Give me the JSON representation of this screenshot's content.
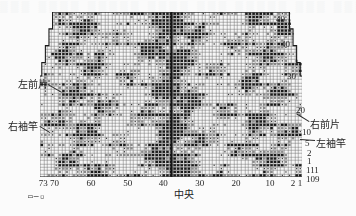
{
  "figure": {
    "kind": "knitting-chart",
    "shape": "trapezoid-stepped",
    "ghost_top": "▒▒▒  ▒▒▒▒  ▒▒▒▒▒  ▒▒▒▒  ▒▒▒  ▒▒▒▒▒  ▒▒▒  ▒▒▒▒",
    "ghost_bottom": " "
  },
  "labels": {
    "left": [
      {
        "text": "左前片",
        "x": 18,
        "y": 80
      },
      {
        "text": "右袖竿",
        "x": 8,
        "y": 122
      }
    ],
    "right": [
      {
        "text": "右前片",
        "x": 310,
        "y": 120
      },
      {
        "text": "左袖竿",
        "x": 316,
        "y": 139
      }
    ],
    "center_bottom": {
      "text": "中央",
      "x": 174,
      "y": 190
    }
  },
  "row_numbers": [
    {
      "value": "49",
      "x": 276,
      "y": 15
    },
    {
      "value": "40",
      "x": 281,
      "y": 40
    },
    {
      "value": "30",
      "x": 287,
      "y": 72
    },
    {
      "value": "20",
      "x": 296,
      "y": 106
    },
    {
      "value": "10",
      "x": 302,
      "y": 128
    },
    {
      "value": "5",
      "x": 305,
      "y": 139
    },
    {
      "value": "2",
      "x": 307,
      "y": 149
    },
    {
      "value": "1",
      "x": 307,
      "y": 157
    },
    {
      "value": "111",
      "x": 306,
      "y": 166
    },
    {
      "value": "109",
      "x": 306,
      "y": 175
    }
  ],
  "x_ticks": [
    {
      "value": "73",
      "pos": 0.012
    },
    {
      "value": "70",
      "pos": 0.055
    },
    {
      "value": "60",
      "pos": 0.195
    },
    {
      "value": "50",
      "pos": 0.335
    },
    {
      "value": "40",
      "pos": 0.47
    },
    {
      "value": "30",
      "pos": 0.61
    },
    {
      "value": "20",
      "pos": 0.748
    },
    {
      "value": "10",
      "pos": 0.878
    },
    {
      "value": "2",
      "pos": 0.966
    },
    {
      "value": "1",
      "pos": 0.992
    }
  ],
  "legend_symbol": "▭─▫",
  "colors": {
    "ink": "#232323",
    "grid": "#6b6b6b",
    "fill_dark": "#1a1a1a",
    "fill_mid": "#8a8a8a",
    "paper": "#fbfbfb",
    "center_line": "#141414"
  },
  "chart_data": {
    "type": "heatmap",
    "title": "",
    "xlabel": "",
    "ylabel": "",
    "grid": true,
    "legend": "none",
    "cols": 73,
    "rows": 49,
    "x_tick_labels": [
      "73",
      "70",
      "60",
      "50",
      "40",
      "30",
      "20",
      "10",
      "2",
      "1"
    ],
    "y_tick_labels": [
      "49",
      "40",
      "30",
      "20",
      "10",
      "5",
      "2",
      "1",
      "111",
      "109"
    ],
    "center_column": 37,
    "outline_half_widths": [
      33,
      33,
      33,
      33,
      33,
      34,
      34,
      34,
      34,
      34,
      35,
      35,
      35,
      35,
      35,
      36,
      36,
      36,
      36,
      37,
      37,
      37,
      37,
      38,
      38,
      38,
      38,
      39,
      39,
      39,
      39,
      40,
      40,
      40,
      41,
      41,
      41,
      42,
      42,
      42,
      43,
      43,
      44,
      44,
      45,
      45,
      46,
      46,
      47
    ],
    "note": "Dark cells mark patterned stitches; staircase edges mark increases each few rows."
  }
}
